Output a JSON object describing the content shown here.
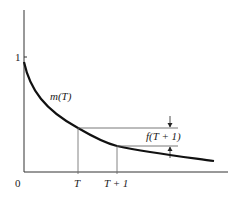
{
  "diagram": {
    "y_tick_label": "1",
    "origin_label": "0",
    "curve_label": "m(T)",
    "x_labels": [
      "T",
      "T + 1"
    ],
    "gap_label": "f(T + 1)",
    "colors": {
      "ink": "#111111",
      "thin": "#555555",
      "background": "#ffffff"
    }
  }
}
